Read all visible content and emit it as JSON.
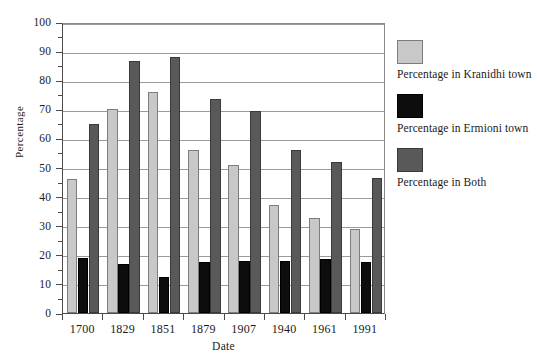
{
  "chart_data": {
    "type": "bar",
    "title": "",
    "xlabel": "Date",
    "ylabel": "Percentage",
    "categories": [
      "1700",
      "1829",
      "1851",
      "1879",
      "1907",
      "1940",
      "1961",
      "1991"
    ],
    "series": [
      {
        "name": "Percentage in Kranidhi town",
        "color": "#c8c8c8",
        "values": [
          46,
          70,
          76,
          56,
          51,
          37,
          32.5,
          29
        ]
      },
      {
        "name": "Percentage in Ermioni town",
        "color": "#0d0d0d",
        "values": [
          19,
          17,
          12.5,
          17.5,
          18,
          18,
          18.5,
          17.5
        ]
      },
      {
        "name": "Percentage in Both",
        "color": "#595959",
        "values": [
          65,
          86.5,
          88,
          73.5,
          69.5,
          56,
          52,
          46.5
        ]
      }
    ],
    "ylim": [
      0,
      100
    ],
    "ytick_values": [
      0,
      10,
      20,
      30,
      40,
      50,
      60,
      70,
      80,
      90,
      100
    ],
    "ytick_labels": [
      "0",
      "10",
      "20",
      "30",
      "40",
      "50",
      "60",
      "70",
      "80",
      "90",
      "100"
    ],
    "grid": true,
    "legend_position": "right"
  },
  "legend": {
    "entries": [
      {
        "label": "Percentage in Kranidhi town"
      },
      {
        "label": "Percentage in Ermioni town"
      },
      {
        "label": "Percentage in Both"
      }
    ]
  }
}
